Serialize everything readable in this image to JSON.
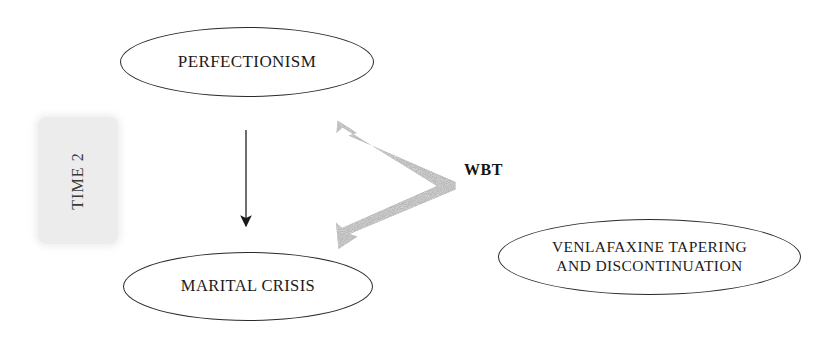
{
  "diagram": {
    "title_text_present": false,
    "background_color": "#ffffff",
    "nodes": [
      {
        "id": "perfectionism",
        "label": "PERFECTIONISM",
        "shape": "ellipse",
        "border_color": "#2a2a2a",
        "fill_color": "#ffffff"
      },
      {
        "id": "marital_crisis",
        "label": "MARITAL CRISIS",
        "shape": "ellipse",
        "border_color": "#2a2a2a",
        "fill_color": "#ffffff"
      },
      {
        "id": "venlafaxine",
        "label": "VENLAFAXINE TAPERING\nAND DISCONTINUATION",
        "shape": "ellipse",
        "border_color": "#2a2a2a",
        "fill_color": "#ffffff"
      }
    ],
    "time_band": {
      "label": "TIME 2",
      "orientation": "vertical",
      "fill_color": "#ececec",
      "text_color": "#3a3a3a"
    },
    "treatment_label": {
      "label": "WBT",
      "bold": true,
      "color": "#141414"
    },
    "connectors": [
      {
        "id": "perfectionism-to-marital-crisis",
        "type": "straight-arrow",
        "direction": "down",
        "color": "#3a3a3a",
        "from": "perfectionism",
        "to": "marital_crisis"
      },
      {
        "id": "wbt-double-chevron",
        "type": "double-headed-chevron-arrow",
        "color": "#a9a9a9",
        "points_to": [
          "perfectionism",
          "marital_crisis"
        ]
      }
    ]
  }
}
